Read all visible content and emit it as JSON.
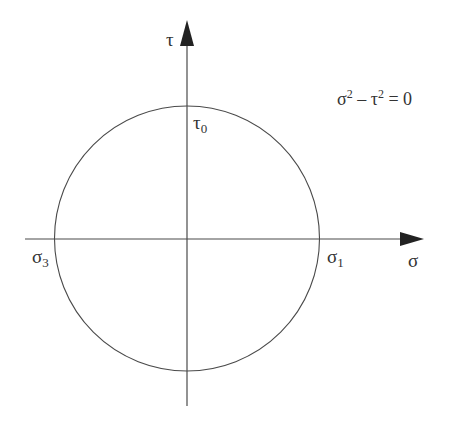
{
  "diagram": {
    "type": "mohr-circle",
    "equation": {
      "lhs_a": "σ",
      "exp_a": "2",
      "minus": " – ",
      "lhs_b": "τ",
      "exp_b": "2",
      "rhs": " = 0"
    },
    "axes": {
      "horizontal": {
        "label": "σ"
      },
      "vertical": {
        "label": "τ"
      }
    },
    "points": {
      "sigma1": {
        "base": "σ",
        "sub": "1"
      },
      "sigma3": {
        "base": "σ",
        "sub": "3"
      },
      "tau0": {
        "base": "τ",
        "sub": "0"
      }
    },
    "colors": {
      "line": "#4a4a4a",
      "text": "#333333"
    }
  }
}
